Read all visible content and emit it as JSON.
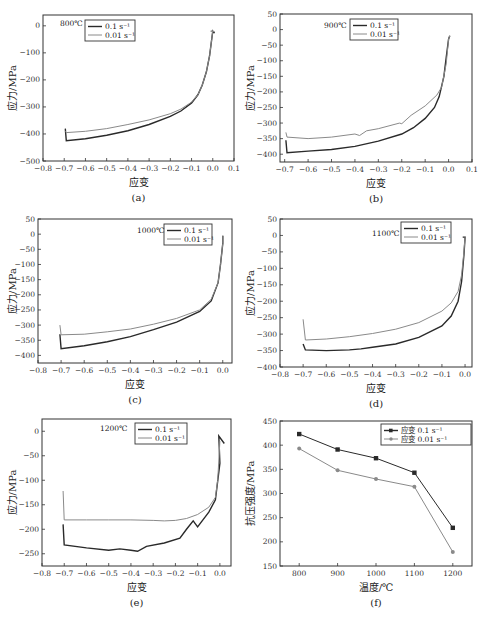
{
  "figure": {
    "y_unit_label": "应力/MPa",
    "x_label": "应变"
  },
  "chart_data": [
    {
      "id": "a",
      "type": "line",
      "sub_label": "(a)",
      "annotation": "800℃",
      "xlabel": "应变",
      "ylabel": "应力/MPa",
      "xlim": [
        -0.8,
        0.1
      ],
      "ylim": [
        -500,
        40
      ],
      "xticks": [
        -0.8,
        -0.7,
        -0.6,
        -0.5,
        -0.4,
        -0.3,
        -0.2,
        -0.1,
        0.0,
        0.1
      ],
      "xtick_labels": [
        "−0.8",
        "−0.7",
        "−0.6",
        "−0.5",
        "−0.4",
        "−0.3",
        "−0.2",
        "−0.1",
        "0.0",
        "0.1"
      ],
      "yticks": [
        -500,
        -400,
        -300,
        -200,
        -100,
        0
      ],
      "ytick_labels": [
        "−500",
        "−400",
        "−300",
        "−200",
        "−100",
        "0"
      ],
      "legend": [
        "0.1 s⁻¹",
        "0.01 s⁻¹"
      ],
      "series": [
        {
          "name": "0.1 s⁻¹",
          "color": "#2a2a2a",
          "x": [
            -0.695,
            -0.69,
            -0.6,
            -0.5,
            -0.4,
            -0.3,
            -0.2,
            -0.15,
            -0.1,
            -0.07,
            -0.05,
            -0.03,
            -0.015,
            -0.005,
            0.0,
            0.005,
            0.01
          ],
          "y": [
            -380,
            -425,
            -418,
            -405,
            -388,
            -365,
            -335,
            -315,
            -285,
            -255,
            -220,
            -170,
            -110,
            -50,
            -20,
            -25,
            -25
          ]
        },
        {
          "name": "0.01 s⁻¹",
          "color": "#8a8a8a",
          "x": [
            -0.695,
            -0.69,
            -0.6,
            -0.5,
            -0.4,
            -0.3,
            -0.2,
            -0.15,
            -0.1,
            -0.07,
            -0.05,
            -0.03,
            -0.015,
            -0.005,
            0.0,
            -0.01,
            0.01
          ],
          "y": [
            -390,
            -395,
            -390,
            -380,
            -365,
            -348,
            -325,
            -308,
            -282,
            -255,
            -220,
            -170,
            -110,
            -50,
            -18,
            -20,
            -22
          ]
        }
      ]
    },
    {
      "id": "b",
      "type": "line",
      "sub_label": "(b)",
      "annotation": "900℃",
      "xlabel": "应变",
      "ylabel": "应力/MPa",
      "xlim": [
        -0.72,
        0.1
      ],
      "ylim": [
        -425,
        50
      ],
      "xticks": [
        -0.7,
        -0.6,
        -0.5,
        -0.4,
        -0.3,
        -0.2,
        -0.1,
        0.0,
        0.1
      ],
      "xtick_labels": [
        "−0.7",
        "−0.6",
        "−0.5",
        "−0.4",
        "−0.3",
        "−0.2",
        "−0.1",
        "0.0",
        "0.1"
      ],
      "yticks": [
        -400,
        -350,
        -300,
        -250,
        -200,
        -150,
        -100,
        -50,
        0,
        50
      ],
      "ytick_labels": [
        "−400",
        "−350",
        "−300",
        "−250",
        "−200",
        "−150",
        "−100",
        "−50",
        "0",
        "50"
      ],
      "legend": [
        "0.1 s⁻¹",
        "0.01 s⁻¹"
      ],
      "series": [
        {
          "name": "0.1 s⁻¹",
          "color": "#2a2a2a",
          "x": [
            -0.695,
            -0.69,
            -0.6,
            -0.5,
            -0.4,
            -0.3,
            -0.2,
            -0.15,
            -0.1,
            -0.06,
            -0.04,
            -0.02,
            -0.01,
            0.0,
            0.005
          ],
          "y": [
            -355,
            -395,
            -390,
            -385,
            -375,
            -358,
            -335,
            -315,
            -285,
            -250,
            -215,
            -150,
            -90,
            -30,
            -20
          ]
        },
        {
          "name": "0.01 s⁻¹",
          "color": "#8a8a8a",
          "x": [
            -0.695,
            -0.69,
            -0.6,
            -0.5,
            -0.4,
            -0.38,
            -0.35,
            -0.3,
            -0.21,
            -0.2,
            -0.16,
            -0.1,
            -0.05,
            -0.03,
            -0.01,
            0.0,
            0.005
          ],
          "y": [
            -330,
            -345,
            -350,
            -345,
            -335,
            -340,
            -325,
            -318,
            -300,
            -302,
            -275,
            -245,
            -210,
            -185,
            -110,
            -30,
            -20
          ]
        }
      ]
    },
    {
      "id": "c",
      "type": "line",
      "sub_label": "(c)",
      "annotation": "1000℃",
      "xlabel": "应变",
      "ylabel": "应力/MPa",
      "xlim": [
        -0.8,
        0.04
      ],
      "ylim": [
        -425,
        50
      ],
      "xticks": [
        -0.8,
        -0.7,
        -0.6,
        -0.5,
        -0.4,
        -0.3,
        -0.2,
        -0.1,
        0.0
      ],
      "xtick_labels": [
        "−0.8",
        "−0.7",
        "−0.6",
        "−0.5",
        "−0.4",
        "−0.3",
        "−0.2",
        "−0.1",
        "0.0"
      ],
      "yticks": [
        -400,
        -350,
        -300,
        -250,
        -200,
        -150,
        -100,
        -50,
        0,
        50
      ],
      "ytick_labels": [
        "−400",
        "−350",
        "−300",
        "−250",
        "−200",
        "−150",
        "−100",
        "−50",
        "0",
        "50"
      ],
      "legend": [
        "0.1 s⁻¹",
        "0.01 s⁻¹"
      ],
      "series": [
        {
          "name": "0.1 s⁻¹",
          "color": "#2a2a2a",
          "x": [
            -0.705,
            -0.7,
            -0.6,
            -0.5,
            -0.4,
            -0.3,
            -0.2,
            -0.1,
            -0.05,
            -0.02,
            -0.01,
            0.0,
            0.0
          ],
          "y": [
            -330,
            -378,
            -368,
            -355,
            -338,
            -315,
            -290,
            -255,
            -220,
            -160,
            -100,
            -30,
            -5
          ]
        },
        {
          "name": "0.01 s⁻¹",
          "color": "#8a8a8a",
          "x": [
            -0.705,
            -0.7,
            -0.6,
            -0.5,
            -0.4,
            -0.3,
            -0.2,
            -0.1,
            -0.05,
            -0.02,
            -0.01,
            0.0,
            0.0
          ],
          "y": [
            -300,
            -332,
            -330,
            -322,
            -313,
            -297,
            -278,
            -250,
            -215,
            -160,
            -100,
            -30,
            -5
          ]
        }
      ]
    },
    {
      "id": "d",
      "type": "line",
      "sub_label": "(d)",
      "annotation": "1100℃",
      "xlabel": "应变",
      "ylabel": "应力/MPa",
      "xlim": [
        -0.8,
        0.03
      ],
      "ylim": [
        -400,
        50
      ],
      "xticks": [
        -0.8,
        -0.7,
        -0.6,
        -0.5,
        -0.4,
        -0.3,
        -0.2,
        -0.1,
        0.0
      ],
      "xtick_labels": [
        "−0.8",
        "−0.7",
        "−0.6",
        "−0.5",
        "−0.4",
        "−0.3",
        "−0.2",
        "−0.1",
        "0.0"
      ],
      "yticks": [
        -400,
        -350,
        -300,
        -250,
        -200,
        -150,
        -100,
        -50,
        0,
        50
      ],
      "ytick_labels": [
        "−400",
        "−350",
        "−300",
        "−250",
        "−200",
        "−150",
        "−100",
        "−50",
        "0",
        "50"
      ],
      "legend": [
        "0.1 s⁻¹",
        "0.01 s⁻¹"
      ],
      "series": [
        {
          "name": "0.1 s⁻¹",
          "color": "#2a2a2a",
          "x": [
            -0.7,
            -0.69,
            -0.6,
            -0.5,
            -0.45,
            -0.4,
            -0.3,
            -0.2,
            -0.1,
            -0.06,
            -0.03,
            -0.015,
            -0.005,
            0.0,
            -0.01
          ],
          "y": [
            -330,
            -348,
            -350,
            -348,
            -345,
            -340,
            -330,
            -310,
            -275,
            -245,
            -200,
            -140,
            -60,
            -5,
            -5
          ]
        },
        {
          "name": "0.01 s⁻¹",
          "color": "#8a8a8a",
          "x": [
            -0.7,
            -0.69,
            -0.6,
            -0.5,
            -0.4,
            -0.3,
            -0.2,
            -0.1,
            -0.06,
            -0.03,
            -0.015,
            -0.005,
            0.0
          ],
          "y": [
            -255,
            -318,
            -315,
            -308,
            -298,
            -285,
            -265,
            -230,
            -205,
            -170,
            -120,
            -50,
            -5
          ]
        }
      ]
    },
    {
      "id": "e",
      "type": "line",
      "sub_label": "(e)",
      "annotation": "1200℃",
      "xlabel": "应变",
      "ylabel": "应力/MPa",
      "xlim": [
        -0.8,
        0.05
      ],
      "ylim": [
        -275,
        25
      ],
      "xticks": [
        -0.8,
        -0.7,
        -0.6,
        -0.5,
        -0.4,
        -0.3,
        -0.2,
        -0.1,
        0.0
      ],
      "xtick_labels": [
        "−0.8",
        "−0.7",
        "−0.6",
        "−0.5",
        "−0.4",
        "−0.3",
        "−0.2",
        "−0.1",
        "0.0"
      ],
      "yticks": [
        -250,
        -200,
        -150,
        -100,
        -50,
        0
      ],
      "ytick_labels": [
        "−250",
        "−200",
        "−150",
        "−100",
        "−50",
        "0"
      ],
      "legend": [
        "0.1 s⁻¹",
        "0.01 s⁻¹"
      ],
      "series": [
        {
          "name": "0.1 s⁻¹",
          "color": "#2a2a2a",
          "x": [
            -0.705,
            -0.7,
            -0.6,
            -0.5,
            -0.45,
            -0.4,
            -0.37,
            -0.33,
            -0.25,
            -0.18,
            -0.15,
            -0.12,
            -0.1,
            -0.05,
            -0.02,
            0.0,
            -0.005,
            0.02
          ],
          "y": [
            -190,
            -232,
            -238,
            -243,
            -240,
            -243,
            -245,
            -235,
            -228,
            -218,
            -200,
            -183,
            -195,
            -165,
            -140,
            -65,
            -10,
            -25
          ]
        },
        {
          "name": "0.01 s⁻¹",
          "color": "#8a8a8a",
          "x": [
            -0.705,
            -0.7,
            -0.6,
            -0.5,
            -0.4,
            -0.3,
            -0.25,
            -0.2,
            -0.15,
            -0.1,
            -0.05,
            -0.02,
            -0.01,
            0.0
          ],
          "y": [
            -122,
            -181,
            -181,
            -181,
            -181,
            -182,
            -183,
            -182,
            -178,
            -170,
            -155,
            -135,
            -100,
            -20
          ]
        }
      ]
    },
    {
      "id": "f",
      "type": "line",
      "sub_label": "(f)",
      "title": "",
      "xlabel": "温度/℃",
      "ylabel": "抗压强度/MPa",
      "xlim": [
        750,
        1250
      ],
      "ylim": [
        150,
        450
      ],
      "xticks": [
        800,
        900,
        1000,
        1100,
        1200
      ],
      "xtick_labels": [
        "800",
        "900",
        "1000",
        "1100",
        "1200"
      ],
      "yticks": [
        150,
        200,
        250,
        300,
        350,
        400,
        450
      ],
      "ytick_labels": [
        "150",
        "200",
        "250",
        "300",
        "350",
        "400",
        "450"
      ],
      "legend": [
        "应变 0.1 s⁻¹",
        "应变 0.01 s⁻¹"
      ],
      "categories": [
        800,
        900,
        1000,
        1100,
        1200
      ],
      "series": [
        {
          "name": "应变 0.1 s⁻¹",
          "color": "#2a2a2a",
          "marker": "square",
          "x": [
            800,
            900,
            1000,
            1100,
            1200
          ],
          "values": [
            423,
            391,
            373,
            343,
            229
          ]
        },
        {
          "name": "应变 0.01 s⁻¹",
          "color": "#8a8a8a",
          "marker": "circle",
          "x": [
            800,
            900,
            1000,
            1100,
            1200
          ],
          "values": [
            393,
            348,
            330,
            314,
            179
          ]
        }
      ]
    }
  ]
}
